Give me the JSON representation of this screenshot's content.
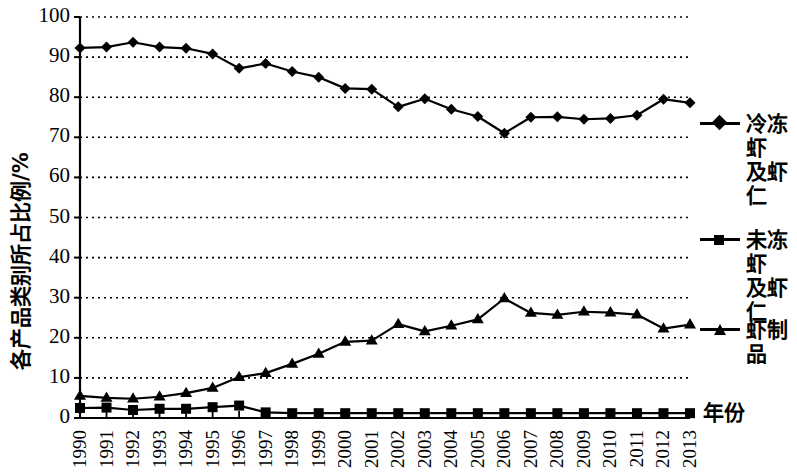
{
  "chart_data": {
    "type": "line",
    "title": "",
    "xlabel": "年份",
    "ylabel": "各产品类别所占比例/%",
    "ylim": [
      0,
      100
    ],
    "ytick_step": 10,
    "grid": true,
    "grid_style": "dotted horizontal",
    "legend_position": "right",
    "x": [
      "1990",
      "1991",
      "1992",
      "1993",
      "1994",
      "1995",
      "1996",
      "1997",
      "1998",
      "1999",
      "2000",
      "2001",
      "2002",
      "2003",
      "2004",
      "2005",
      "2006",
      "2007",
      "2008",
      "2009",
      "2010",
      "2011",
      "2012",
      "2013"
    ],
    "categories": [
      "1990",
      "1991",
      "1992",
      "1993",
      "1994",
      "1995",
      "1996",
      "1997",
      "1998",
      "1999",
      "2000",
      "2001",
      "2002",
      "2003",
      "2004",
      "2005",
      "2006",
      "2007",
      "2008",
      "2009",
      "2010",
      "2011",
      "2012",
      "2013"
    ],
    "yticks": [
      "0",
      "10",
      "20",
      "30",
      "40",
      "50",
      "60",
      "70",
      "80",
      "90",
      "100"
    ],
    "series": [
      {
        "name": "冷冻虾及虾仁",
        "legend_label": "冷冻虾\n及虾仁",
        "marker": "diamond",
        "color": "#000000",
        "values": [
          92.3,
          92.5,
          93.7,
          92.5,
          92.2,
          90.8,
          87.2,
          88.4,
          86.4,
          85.0,
          82.2,
          82.0,
          77.6,
          79.6,
          77.0,
          75.2,
          71.0,
          75.0,
          75.1,
          74.5,
          74.7,
          75.5,
          79.5,
          78.6
        ]
      },
      {
        "name": "未冻虾及虾仁",
        "legend_label": "未冻虾\n及虾仁",
        "marker": "square",
        "color": "#000000",
        "values": [
          2.5,
          2.6,
          2.0,
          2.3,
          2.3,
          2.7,
          3.1,
          1.4,
          1.2,
          1.2,
          1.2,
          1.2,
          1.2,
          1.2,
          1.2,
          1.2,
          1.2,
          1.2,
          1.2,
          1.2,
          1.2,
          1.2,
          1.2,
          1.2
        ]
      },
      {
        "name": "虾制品",
        "legend_label": "虾制品",
        "marker": "triangle",
        "color": "#000000",
        "values": [
          5.5,
          5.0,
          4.8,
          5.3,
          6.2,
          7.5,
          10.2,
          11.2,
          13.5,
          16.0,
          19.0,
          19.3,
          23.4,
          21.6,
          23.0,
          24.6,
          29.8,
          26.2,
          25.7,
          26.5,
          26.3,
          25.8,
          22.3,
          23.3
        ]
      }
    ]
  },
  "axes": {
    "x_axis_label": "年份",
    "y_axis_label": "各产品类别所占比例/%"
  },
  "legend": {
    "items": [
      {
        "label": "冷冻虾\n及虾仁",
        "marker": "diamond"
      },
      {
        "label": "未冻虾\n及虾仁",
        "marker": "square"
      },
      {
        "label": "虾制品",
        "marker": "triangle"
      }
    ]
  }
}
